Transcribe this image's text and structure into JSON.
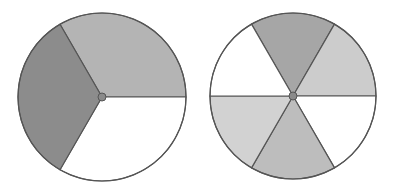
{
  "figure": {
    "background": "#ffffff",
    "stroke_color": "#555555",
    "hub_color": "#8a8a8a"
  },
  "spinners": [
    {
      "name": "spinner-three-sectors",
      "cx": 102,
      "cy": 97,
      "r": 84,
      "sectors": [
        {
          "start_deg": -120,
          "end_deg": 0,
          "fill": "#b4b4b4",
          "label": "light gray"
        },
        {
          "start_deg": 0,
          "end_deg": 120,
          "fill": "#ffffff",
          "label": "white"
        },
        {
          "start_deg": 120,
          "end_deg": 240,
          "fill": "#8c8c8c",
          "label": "dark gray"
        }
      ]
    },
    {
      "name": "spinner-six-sectors",
      "cx": 293,
      "cy": 96,
      "r": 83,
      "sectors": [
        {
          "start_deg": -120,
          "end_deg": -60,
          "fill": "#a6a6a6",
          "label": "dark gray"
        },
        {
          "start_deg": -60,
          "end_deg": 0,
          "fill": "#cccccc",
          "label": "light gray"
        },
        {
          "start_deg": 0,
          "end_deg": 60,
          "fill": "#ffffff",
          "label": "white"
        },
        {
          "start_deg": 60,
          "end_deg": 120,
          "fill": "#bdbdbd",
          "label": "medium gray"
        },
        {
          "start_deg": 120,
          "end_deg": 180,
          "fill": "#d2d2d2",
          "label": "light gray"
        },
        {
          "start_deg": 180,
          "end_deg": 240,
          "fill": "#ffffff",
          "label": "white"
        }
      ]
    }
  ]
}
